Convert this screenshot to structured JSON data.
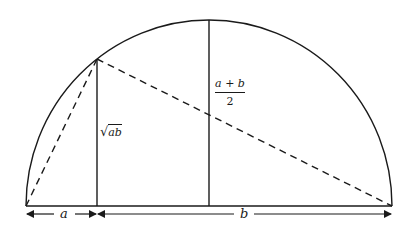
{
  "diagram": {
    "colors": {
      "stroke": "#1a1a1a",
      "background": "#ffffff"
    },
    "labels": {
      "segment_a": "a",
      "segment_b": "b",
      "geometric_mean_radical": "√",
      "geometric_mean_radicand": "ab",
      "arithmetic_mean_numerator": "a + b",
      "arithmetic_mean_denominator": "2"
    },
    "geometry": {
      "baseline": {
        "x1": 26,
        "x2": 392,
        "y": 206
      },
      "center": {
        "x": 209,
        "y": 206
      },
      "radius": 183,
      "arc_point": {
        "x": 97,
        "y": 59
      },
      "arrow_row_y": 214
    }
  }
}
